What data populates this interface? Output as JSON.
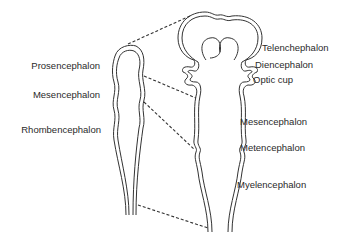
{
  "diagram": {
    "colors": {
      "line": "#333333",
      "text": "#2a2a2a",
      "background": "#ffffff"
    },
    "early_stage": {
      "labels": [
        {
          "id": "prosencephalon",
          "text": "Prosencephalon"
        },
        {
          "id": "mesencephalon",
          "text": "Mesencephalon"
        },
        {
          "id": "rhombencephalon",
          "text": "Rhombencephalon"
        }
      ]
    },
    "later_stage": {
      "labels": [
        {
          "id": "telencephalon",
          "text": "Telenchephalon"
        },
        {
          "id": "diencephalon",
          "text": "Diencephalon"
        },
        {
          "id": "optic-cup",
          "text": "Optic cup"
        },
        {
          "id": "mesencephalon",
          "text": "Mesencephalon"
        },
        {
          "id": "metencephalon",
          "text": "Metencephalon"
        },
        {
          "id": "myelencephalon",
          "text": "Myelencephalon"
        }
      ]
    }
  }
}
